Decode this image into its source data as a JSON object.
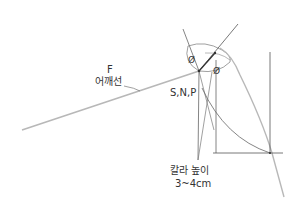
{
  "diagram": {
    "labels": {
      "f": "F",
      "shoulder_line": "어깨선",
      "snp": "S,N,P",
      "collar_height": "칼라 높이",
      "collar_height_value": "3~4cm",
      "angle_1": "Ø",
      "angle_2": "Ø"
    },
    "colors": {
      "line": "#555555",
      "gray_line": "#b5b5b5",
      "text": "#333333"
    }
  }
}
